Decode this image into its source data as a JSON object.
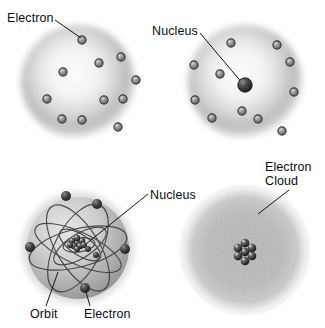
{
  "figure": {
    "background": "#ffffff",
    "width": 325,
    "height": 328,
    "ink_color": "#111111",
    "sphere_color": "#b9b9b9",
    "particle_color": "#4a4a4a"
  },
  "panels": [
    {
      "id": "plum-pudding-model",
      "name": "Thomson plum pudding model",
      "position": "top-left",
      "center": {
        "x": 78,
        "y": 82
      },
      "radius": 58,
      "style": "diffuse positive sphere with embedded electrons",
      "nucleus": null,
      "electron_count": 11,
      "electrons": [
        {
          "x": 82,
          "y": 40
        },
        {
          "x": 121,
          "y": 57
        },
        {
          "x": 99,
          "y": 63
        },
        {
          "x": 136,
          "y": 80
        },
        {
          "x": 63,
          "y": 72
        },
        {
          "x": 123,
          "y": 99
        },
        {
          "x": 104,
          "y": 100
        },
        {
          "x": 47,
          "y": 99
        },
        {
          "x": 82,
          "y": 120
        },
        {
          "x": 62,
          "y": 119
        },
        {
          "x": 118,
          "y": 127
        }
      ],
      "labels": [
        {
          "text": "Electron",
          "anchor": {
            "x": 52,
            "y": 22
          },
          "leader_to": {
            "x": 82,
            "y": 40
          }
        }
      ]
    },
    {
      "id": "rutherford-nuclear-model",
      "name": "Rutherford nuclear model",
      "position": "top-right",
      "center": {
        "x": 245,
        "y": 82
      },
      "radius": 58,
      "style": "dense central nucleus with orbiting electrons",
      "nucleus": {
        "x": 245,
        "y": 85,
        "radius": 7
      },
      "electron_count": 11,
      "electrons": [
        {
          "x": 231,
          "y": 43
        },
        {
          "x": 277,
          "y": 45
        },
        {
          "x": 290,
          "y": 62
        },
        {
          "x": 220,
          "y": 74
        },
        {
          "x": 294,
          "y": 92
        },
        {
          "x": 194,
          "y": 65
        },
        {
          "x": 195,
          "y": 100
        },
        {
          "x": 212,
          "y": 118
        },
        {
          "x": 242,
          "y": 111
        },
        {
          "x": 258,
          "y": 119
        },
        {
          "x": 282,
          "y": 131
        }
      ],
      "labels": [
        {
          "text": "Nucleus",
          "anchor": {
            "x": 198,
            "y": 31
          },
          "leader_to": {
            "x": 245,
            "y": 85
          }
        }
      ]
    },
    {
      "id": "bohr-orbit-model",
      "name": "Bohr orbital model",
      "position": "bottom-left",
      "center": {
        "x": 78,
        "y": 248
      },
      "radius": 58,
      "style": "elliptical electron orbits around a clustered nucleus",
      "nucleus": {
        "x": 77,
        "y": 243,
        "radius": 9,
        "particle_count": 9
      },
      "orbit_count": 6,
      "electron_count": 6,
      "electrons": [
        {
          "x": 66,
          "y": 196
        },
        {
          "x": 97,
          "y": 204
        },
        {
          "x": 125,
          "y": 249
        },
        {
          "x": 30,
          "y": 247
        },
        {
          "x": 96,
          "y": 255
        },
        {
          "x": 85,
          "y": 288
        }
      ],
      "labels": [
        {
          "text": "Nucleus",
          "anchor": {
            "x": 186,
            "y": 195
          },
          "leader_to": {
            "x": 86,
            "y": 244
          }
        },
        {
          "text": "Orbit",
          "anchor": {
            "x": 44,
            "y": 314
          },
          "leader_to": {
            "x": 57,
            "y": 273
          }
        },
        {
          "text": "Electron",
          "anchor": {
            "x": 106,
            "y": 314
          },
          "leader_to": {
            "x": 86,
            "y": 288
          }
        }
      ]
    },
    {
      "id": "quantum-cloud-model",
      "name": "Quantum mechanical electron cloud model",
      "position": "bottom-right",
      "center": {
        "x": 245,
        "y": 250
      },
      "radius": 63,
      "style": "grainy probability cloud around a clustered nucleus",
      "nucleus": {
        "x": 245,
        "y": 252,
        "radius": 11,
        "particle_count": 7
      },
      "electron_count": 0,
      "electrons": [],
      "labels": [
        {
          "text": "Electron Cloud",
          "anchor": {
            "x": 292,
            "y": 170
          },
          "leader_to": {
            "x": 257,
            "y": 213
          }
        }
      ]
    }
  ],
  "labels": {
    "top_left_electron": "Electron",
    "top_right_nucleus": "Nucleus",
    "bottom_left_nucleus": "Nucleus",
    "bottom_left_orbit": "Orbit",
    "bottom_left_electron": "Electron",
    "bottom_right_cloud_line1": "Electron",
    "bottom_right_cloud_line2": "Cloud"
  }
}
